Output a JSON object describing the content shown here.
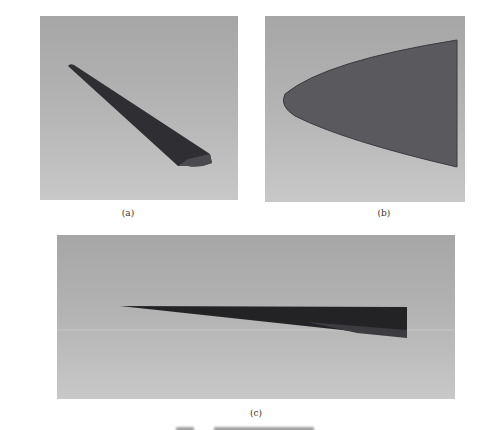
{
  "figure": {
    "panels": [
      {
        "id": "a",
        "label": "(a)",
        "content": "3D rendered tapered wing view, dark grey on grey gradient background"
      },
      {
        "id": "b",
        "label": "(b)",
        "content": "Parabolic planform shape (ogive), medium grey fill"
      },
      {
        "id": "c",
        "label": "(c)",
        "content": "Side view of thin tapered wedge, dark fill"
      }
    ],
    "colors": {
      "background_top": "#a6a6a6",
      "background_bottom": "#c8c8c8",
      "shape_a": "#2e2e33",
      "shape_b": "#5a5a5e",
      "shape_c": "#232326"
    }
  }
}
